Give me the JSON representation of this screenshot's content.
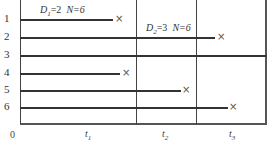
{
  "diagram": {
    "type": "timeline-replacement",
    "origin_label": "0",
    "row_labels": [
      "1",
      "2",
      "3",
      "4",
      "5",
      "6"
    ],
    "annotations": [
      {
        "var": "D",
        "sub": "1",
        "value": "=2",
        "n_text": "N=6"
      },
      {
        "var": "D",
        "sub": "2",
        "value": "=3",
        "n_text": "N=6"
      }
    ],
    "intervals": [
      {
        "var": "t",
        "sub": "1"
      },
      {
        "var": "t",
        "sub": "2"
      },
      {
        "var": "t",
        "sub": "3"
      }
    ],
    "rows": [
      {
        "label": "1",
        "end_x": 113,
        "failed": true
      },
      {
        "label": "2",
        "end_x": 215,
        "failed": true
      },
      {
        "label": "3",
        "end_x": 267,
        "failed": false
      },
      {
        "label": "4",
        "end_x": 120,
        "failed": true
      },
      {
        "label": "5",
        "end_x": 181,
        "failed": true
      },
      {
        "label": "6",
        "end_x": 228,
        "failed": true
      }
    ],
    "failure_marker": "×"
  }
}
